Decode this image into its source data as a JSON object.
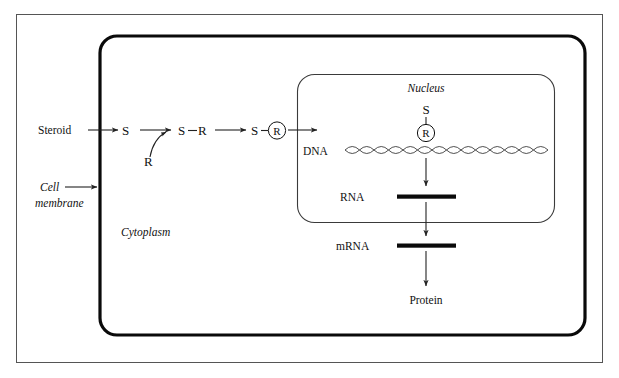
{
  "diagram": {
    "title_present": false,
    "type": "biology-pathway",
    "colors": {
      "ink": "#111111",
      "cell_membrane": "#0a0a0a",
      "nucleus_outline": "#3a3a3a",
      "frame": "#555555",
      "dna_helix": "#3c3c3c",
      "background": "#ffffff"
    },
    "labels": {
      "steroid": "Steroid",
      "cell_membrane_line1": "Cell",
      "cell_membrane_line2": "membrane",
      "cytoplasm": "Cytoplasm",
      "nucleus": "Nucleus",
      "dna": "DNA",
      "rna": "RNA",
      "mrna": "mRNA",
      "protein": "Protein"
    },
    "symbols": {
      "s_free": "S",
      "r_free": "R",
      "s_bound": "S",
      "r_bound": "R",
      "dash": "—",
      "s_complex_left": "S",
      "r_complex_circled": "R",
      "s_on_dna": "S",
      "r_on_dna": "R"
    },
    "steps": [
      {
        "id": "step-1",
        "from": "Steroid",
        "to": "S",
        "note": "steroid crosses cell membrane"
      },
      {
        "id": "step-2",
        "from": "S",
        "to": "S—R",
        "note": "steroid binds receptor R"
      },
      {
        "id": "step-3",
        "from": "S—R",
        "to": "S—Ⓡ",
        "note": "activated steroid-receptor complex"
      },
      {
        "id": "step-4",
        "from": "S—Ⓡ",
        "to": "DNA",
        "note": "complex enters nucleus and binds DNA"
      },
      {
        "id": "step-5",
        "from": "DNA",
        "to": "RNA",
        "note": "transcription"
      },
      {
        "id": "step-6",
        "from": "RNA",
        "to": "mRNA",
        "note": "mRNA exits nucleus"
      },
      {
        "id": "step-7",
        "from": "mRNA",
        "to": "Protein",
        "note": "translation"
      }
    ]
  }
}
